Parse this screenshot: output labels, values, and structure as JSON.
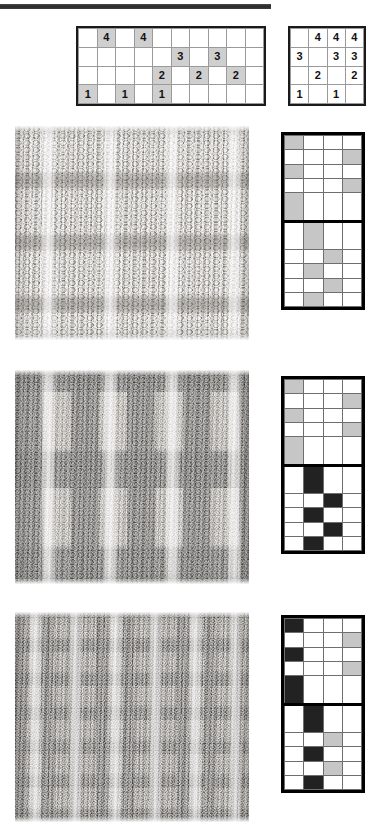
{
  "document": {
    "title": "Knitting stitch pattern charts and swatches",
    "top_rule": "horizontal-rule"
  },
  "charts": {
    "wide_chart": {
      "name": "wide-numbered-chart",
      "columns": 10,
      "rows": 4,
      "cells": [
        [
          {
            "v": "",
            "s": false
          },
          {
            "v": "4",
            "s": true
          },
          {
            "v": "",
            "s": false
          },
          {
            "v": "4",
            "s": true
          },
          {
            "v": "",
            "s": false
          },
          {
            "v": "",
            "s": false
          },
          {
            "v": "",
            "s": false
          },
          {
            "v": "",
            "s": false
          },
          {
            "v": "",
            "s": false
          },
          {
            "v": "",
            "s": false
          }
        ],
        [
          {
            "v": "",
            "s": false
          },
          {
            "v": "",
            "s": false
          },
          {
            "v": "",
            "s": false
          },
          {
            "v": "",
            "s": false
          },
          {
            "v": "",
            "s": false
          },
          {
            "v": "3",
            "s": true
          },
          {
            "v": "",
            "s": false
          },
          {
            "v": "3",
            "s": true
          },
          {
            "v": "",
            "s": false
          },
          {
            "v": "",
            "s": false
          }
        ],
        [
          {
            "v": "",
            "s": false
          },
          {
            "v": "",
            "s": false
          },
          {
            "v": "",
            "s": false
          },
          {
            "v": "",
            "s": false
          },
          {
            "v": "2",
            "s": true
          },
          {
            "v": "",
            "s": false
          },
          {
            "v": "2",
            "s": true
          },
          {
            "v": "",
            "s": false
          },
          {
            "v": "2",
            "s": true
          },
          {
            "v": "",
            "s": false
          }
        ],
        [
          {
            "v": "1",
            "s": true
          },
          {
            "v": "",
            "s": false
          },
          {
            "v": "1",
            "s": true
          },
          {
            "v": "",
            "s": false
          },
          {
            "v": "1",
            "s": true
          },
          {
            "v": "",
            "s": false
          },
          {
            "v": "",
            "s": false
          },
          {
            "v": "",
            "s": false
          },
          {
            "v": "",
            "s": false
          },
          {
            "v": "",
            "s": false
          }
        ]
      ]
    },
    "small_chart": {
      "name": "small-numbered-chart",
      "columns": 4,
      "rows": 4,
      "cells": [
        [
          {
            "v": "",
            "s": false
          },
          {
            "v": "4",
            "s": false
          },
          {
            "v": "4",
            "s": false
          },
          {
            "v": "4",
            "s": false
          }
        ],
        [
          {
            "v": "3",
            "s": false
          },
          {
            "v": "",
            "s": false
          },
          {
            "v": "3",
            "s": false
          },
          {
            "v": "3",
            "s": false
          }
        ],
        [
          {
            "v": "",
            "s": false
          },
          {
            "v": "2",
            "s": false
          },
          {
            "v": "",
            "s": false
          },
          {
            "v": "2",
            "s": false
          }
        ],
        [
          {
            "v": "1",
            "s": false
          },
          {
            "v": "",
            "s": false
          },
          {
            "v": "1",
            "s": false
          },
          {
            "v": "",
            "s": false
          }
        ]
      ]
    }
  },
  "samples": [
    {
      "id": "sample-1",
      "swatch_name": "knit-swatch-cream-cable",
      "swatch_description": "Cream textured knit with vertical cable columns",
      "base_color": "#d8d4cb",
      "chart_name": "pattern-chart-1",
      "columns": 4,
      "rows": 10,
      "grid": [
        [
          "g",
          "w",
          "w",
          "w"
        ],
        [
          "w",
          "w",
          "w",
          "g"
        ],
        [
          "g",
          "w",
          "w",
          "w"
        ],
        [
          "w",
          "w",
          "w",
          "g"
        ],
        [
          "g",
          "w",
          "w",
          "w"
        ],
        [
          "w",
          "g",
          "w",
          "w"
        ],
        [
          "w",
          "w",
          "g",
          "w"
        ],
        [
          "w",
          "g",
          "w",
          "w"
        ],
        [
          "w",
          "w",
          "g",
          "w"
        ],
        [
          "w",
          "g",
          "w",
          "w"
        ]
      ]
    },
    {
      "id": "sample-2",
      "swatch_name": "knit-swatch-black-cream-colorwork",
      "swatch_description": "Two-colour black and cream colourwork with cable columns",
      "base_color": "#cfcabf",
      "chart_name": "pattern-chart-2",
      "columns": 4,
      "rows": 10,
      "grid": [
        [
          "g",
          "w",
          "w",
          "w"
        ],
        [
          "w",
          "w",
          "w",
          "g"
        ],
        [
          "g",
          "w",
          "w",
          "w"
        ],
        [
          "w",
          "w",
          "w",
          "g"
        ],
        [
          "g",
          "w",
          "w",
          "w"
        ],
        [
          "w",
          "k",
          "w",
          "w"
        ],
        [
          "w",
          "w",
          "k",
          "w"
        ],
        [
          "w",
          "k",
          "w",
          "w"
        ],
        [
          "w",
          "w",
          "k",
          "w"
        ],
        [
          "w",
          "k",
          "w",
          "w"
        ]
      ]
    },
    {
      "id": "sample-3",
      "swatch_name": "knit-swatch-fine-mixed-texture",
      "swatch_description": "Fine mixed black and cream texture with dense cables",
      "base_color": "#c9c4b9",
      "chart_name": "pattern-chart-3",
      "columns": 4,
      "rows": 10,
      "grid": [
        [
          "k",
          "w",
          "w",
          "w"
        ],
        [
          "w",
          "w",
          "w",
          "g"
        ],
        [
          "k",
          "w",
          "w",
          "w"
        ],
        [
          "w",
          "w",
          "w",
          "g"
        ],
        [
          "k",
          "w",
          "w",
          "w"
        ],
        [
          "w",
          "k",
          "w",
          "w"
        ],
        [
          "w",
          "w",
          "g",
          "w"
        ],
        [
          "w",
          "k",
          "w",
          "w"
        ],
        [
          "w",
          "w",
          "g",
          "w"
        ],
        [
          "w",
          "k",
          "w",
          "w"
        ]
      ]
    }
  ],
  "legend": {
    "shaded": "#cfcfcf",
    "black": "#222222",
    "white": "#ffffff",
    "border": "#000000"
  }
}
